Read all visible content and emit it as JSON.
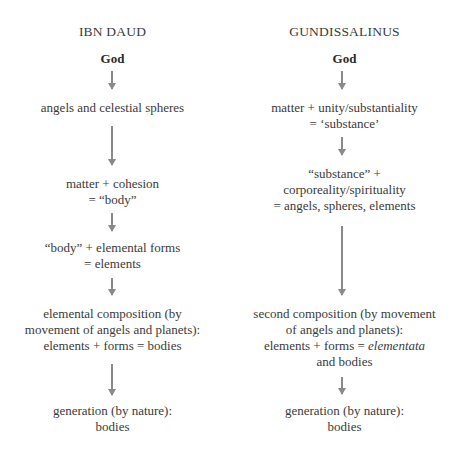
{
  "left": {
    "heading": "IBN DAUD",
    "nodes": [
      {
        "lines": [
          "God"
        ]
      },
      {
        "lines": [
          "angels and celestial spheres"
        ]
      },
      {
        "lines": [
          "matter + cohesion",
          "= “body”"
        ]
      },
      {
        "lines": [
          "“body” + elemental forms",
          "= elements"
        ]
      },
      {
        "lines": [
          "elemental composition (by",
          "movement of angels and planets):",
          "elements + forms = bodies"
        ]
      },
      {
        "lines": [
          "generation (by nature):",
          "bodies"
        ]
      }
    ]
  },
  "right": {
    "heading": "GUNDISSALINUS",
    "nodes": [
      {
        "lines": [
          "God"
        ]
      },
      {
        "lines": [
          "matter + unity/substantiality",
          "= ‘substance’"
        ]
      },
      {
        "lines": [
          "“substance” +",
          "corporeality/spirituality",
          "= angels, spheres, elements"
        ]
      },
      {
        "lines": [
          "second composition (by movement",
          "of angels and planets):",
          "elements + forms = ",
          "elementata",
          "and bodies"
        ]
      },
      {
        "lines": [
          "generation (by nature):",
          "bodies"
        ]
      }
    ]
  },
  "colors": {
    "text": "#3a3a3a",
    "arrow": "#8a8a8a",
    "background": "#ffffff"
  },
  "icons": {
    "arrow": "down-arrow-icon"
  }
}
